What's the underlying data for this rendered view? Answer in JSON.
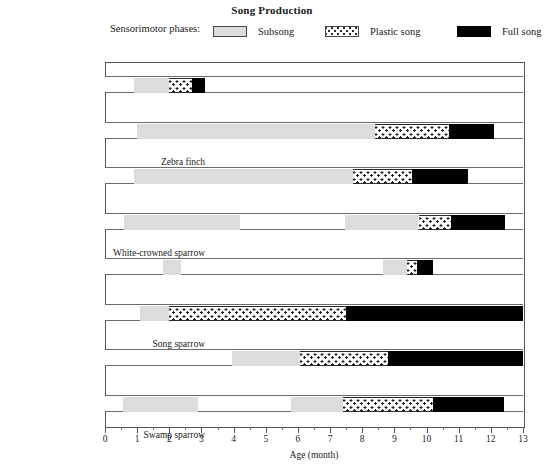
{
  "chart_data": {
    "type": "bar",
    "chart_style": "horizontal stacked / gantt-style timeline",
    "title": "Song Production",
    "xlabel": "Age (month)",
    "ylabel": "",
    "xlim": [
      0,
      13
    ],
    "xticks": [
      0,
      1,
      2,
      3,
      4,
      5,
      6,
      7,
      8,
      9,
      10,
      11,
      12,
      13
    ],
    "xtick_labels": [
      "0",
      "1",
      "2",
      "3",
      "4",
      "5",
      "6",
      "7",
      "8",
      "9",
      "10",
      "11",
      "12",
      "13"
    ],
    "minor_tick_step": 0.5,
    "grid": false,
    "legend_position": "top",
    "legend_caption": "Sensorimotor phases:",
    "legend": [
      {
        "key": "subsong",
        "label": "Subsong",
        "color": "#dcdcdc",
        "pattern": "solid-light-grey"
      },
      {
        "key": "plastic",
        "label": "Plastic song",
        "color": "#ffffff",
        "pattern": "dotted"
      },
      {
        "key": "full",
        "label": "Full song",
        "color": "#000000",
        "pattern": "solid-black"
      }
    ],
    "categories": [
      "Zebra finch",
      "White-crowned sparrow",
      "Song sparrow",
      "Swamp sparrow",
      "Chaffinch",
      "Canary",
      "Starling",
      "Nightingale"
    ],
    "units": "month",
    "series": [
      {
        "category": "Zebra finch",
        "spans": [
          {
            "phase": "subsong",
            "start": 0.9,
            "end": 2.0
          },
          {
            "phase": "plastic",
            "start": 2.0,
            "end": 2.7
          },
          {
            "phase": "full",
            "start": 2.7,
            "end": 3.1
          }
        ]
      },
      {
        "category": "White-crowned sparrow",
        "spans": [
          {
            "phase": "subsong",
            "start": 1.0,
            "end": 8.4
          },
          {
            "phase": "plastic",
            "start": 8.4,
            "end": 10.7
          },
          {
            "phase": "full",
            "start": 10.7,
            "end": 12.1
          }
        ]
      },
      {
        "category": "Song sparrow",
        "spans": [
          {
            "phase": "subsong",
            "start": 0.9,
            "end": 7.7
          },
          {
            "phase": "plastic",
            "start": 7.7,
            "end": 9.55
          },
          {
            "phase": "full",
            "start": 9.55,
            "end": 11.3
          }
        ]
      },
      {
        "category": "Swamp sparrow",
        "spans": [
          {
            "phase": "subsong",
            "start": 0.6,
            "end": 4.2
          },
          {
            "phase": "subsong",
            "start": 7.45,
            "end": 9.75
          },
          {
            "phase": "plastic",
            "start": 9.75,
            "end": 10.75
          },
          {
            "phase": "full",
            "start": 10.75,
            "end": 12.45
          }
        ]
      },
      {
        "category": "Chaffinch",
        "spans": [
          {
            "phase": "subsong",
            "start": 1.8,
            "end": 2.35
          },
          {
            "phase": "subsong",
            "start": 8.65,
            "end": 9.4
          },
          {
            "phase": "plastic",
            "start": 9.4,
            "end": 9.7
          },
          {
            "phase": "full",
            "start": 9.7,
            "end": 10.2
          }
        ]
      },
      {
        "category": "Canary",
        "spans": [
          {
            "phase": "subsong",
            "start": 1.1,
            "end": 2.0
          },
          {
            "phase": "plastic",
            "start": 2.0,
            "end": 7.5
          },
          {
            "phase": "full",
            "start": 7.5,
            "end": 13.0
          }
        ]
      },
      {
        "category": "Starling",
        "spans": [
          {
            "phase": "subsong",
            "start": 3.95,
            "end": 6.05
          },
          {
            "phase": "plastic",
            "start": 6.05,
            "end": 8.8
          },
          {
            "phase": "full",
            "start": 8.8,
            "end": 13.0
          }
        ]
      },
      {
        "category": "Nightingale",
        "spans": [
          {
            "phase": "subsong",
            "start": 0.55,
            "end": 2.9
          },
          {
            "phase": "subsong",
            "start": 5.8,
            "end": 7.4
          },
          {
            "phase": "plastic",
            "start": 7.4,
            "end": 10.2
          },
          {
            "phase": "full",
            "start": 10.2,
            "end": 12.4
          }
        ]
      }
    ]
  }
}
